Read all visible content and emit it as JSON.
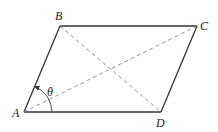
{
  "diagram": {
    "type": "geometry",
    "shape": "parallelogram",
    "vertices": [
      {
        "name": "A",
        "x": 24,
        "y": 112,
        "label_x": 12,
        "label_y": 117
      },
      {
        "name": "B",
        "x": 60,
        "y": 26,
        "label_x": 55,
        "label_y": 20
      },
      {
        "name": "C",
        "x": 197,
        "y": 26,
        "label_x": 200,
        "label_y": 30
      },
      {
        "name": "D",
        "x": 161,
        "y": 112,
        "label_x": 156,
        "label_y": 126
      }
    ],
    "diagonals": [
      {
        "from": "A",
        "to": "C",
        "style": "dashed"
      },
      {
        "from": "B",
        "to": "D",
        "style": "dashed"
      }
    ],
    "angle": {
      "label": "θ",
      "vertex": "A",
      "between": [
        "AD",
        "AB"
      ],
      "label_x": 47,
      "label_y": 95,
      "radius": 28
    },
    "colors": {
      "edge": "#333333",
      "diagonal": "#888888",
      "text": "#222222"
    }
  }
}
